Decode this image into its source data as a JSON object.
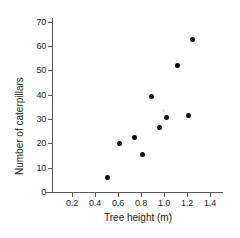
{
  "chart_data": {
    "type": "scatter",
    "title": "",
    "xlabel": "Tree height (m)",
    "ylabel": "Number of caterpillars",
    "xlim": [
      0.1,
      1.5
    ],
    "ylim": [
      0,
      73
    ],
    "grid": false,
    "legend": null,
    "xticks": [
      "0.2",
      "0.4",
      "0.6",
      "0.8",
      "1.0",
      "1.2",
      "1.4"
    ],
    "xtick_values": [
      0.2,
      0.4,
      0.6,
      0.8,
      1.0,
      1.2,
      1.4
    ],
    "yticks": [
      "0",
      "10",
      "20",
      "30",
      "40",
      "50",
      "60",
      "70"
    ],
    "ytick_values": [
      0,
      10,
      20,
      30,
      40,
      50,
      60,
      70
    ],
    "point_color": "#0d0d0d",
    "axis_color": "#5a5a5a",
    "marker": "filled-circle",
    "n_points": 9,
    "x": [
      0.51,
      0.61,
      0.74,
      0.81,
      0.89,
      0.96,
      1.02,
      1.12,
      1.21,
      1.25
    ],
    "points": [
      {
        "x": 0.51,
        "y": 6
      },
      {
        "x": 0.61,
        "y": 20
      },
      {
        "x": 0.74,
        "y": 22.5
      },
      {
        "x": 0.81,
        "y": 15.5
      },
      {
        "x": 0.89,
        "y": 39.5
      },
      {
        "x": 0.96,
        "y": 26.5
      },
      {
        "x": 1.02,
        "y": 30.5
      },
      {
        "x": 1.12,
        "y": 52
      },
      {
        "x": 1.21,
        "y": 31.5
      },
      {
        "x": 1.25,
        "y": 63
      }
    ]
  }
}
